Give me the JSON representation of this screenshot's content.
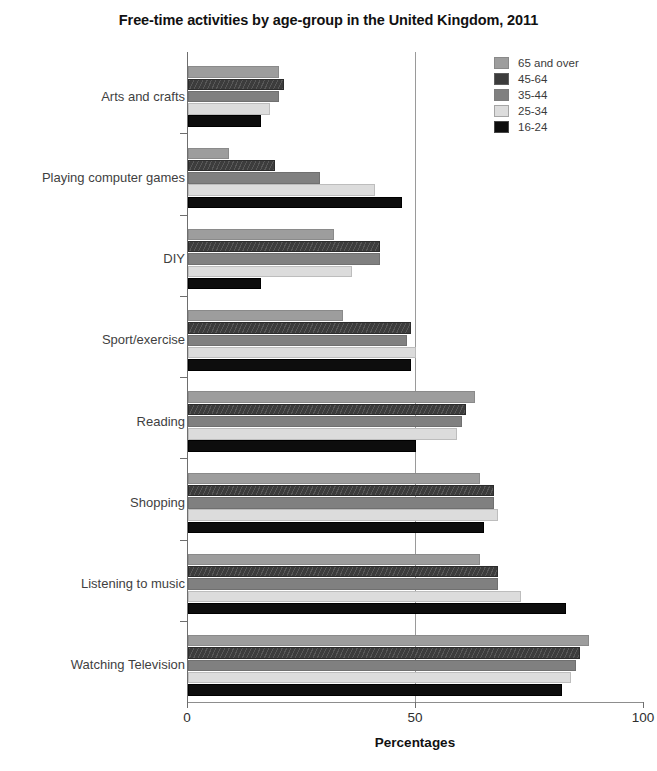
{
  "chart_data": {
    "type": "bar",
    "orientation": "horizontal",
    "title": "Free-time activities by age-group in the United Kingdom, 2011",
    "xlabel": "Percentages",
    "ylabel": "",
    "xlim": [
      0,
      100
    ],
    "xticks": [
      0,
      50,
      100
    ],
    "xtick_labels": [
      "0",
      "50",
      "100"
    ],
    "grid": "vertical gridline at 50",
    "legend_position": "top-right",
    "categories": [
      "Arts and crafts",
      "Playing computer games",
      "DIY",
      "Sport/exercise",
      "Reading",
      "Shopping",
      "Listening to music",
      "Watching Television"
    ],
    "series": [
      {
        "name": "65 and over",
        "color": "#9d9d9d",
        "values": [
          20,
          9,
          32,
          34,
          63,
          64,
          64,
          88
        ]
      },
      {
        "name": "45-64",
        "color": "#3c3c3c",
        "values": [
          21,
          19,
          42,
          49,
          61,
          67,
          68,
          86
        ]
      },
      {
        "name": "35-44",
        "color": "#808080",
        "values": [
          20,
          29,
          42,
          48,
          60,
          67,
          68,
          85
        ]
      },
      {
        "name": "25-34",
        "color": "#dcdcdc",
        "values": [
          18,
          41,
          36,
          50,
          59,
          68,
          73,
          84
        ]
      },
      {
        "name": "16-24",
        "color": "#0d0d0d",
        "values": [
          16,
          47,
          16,
          49,
          50,
          65,
          83,
          82
        ]
      }
    ]
  },
  "legend": {
    "items": [
      {
        "label": "65 and over",
        "swatch": "#9d9d9d"
      },
      {
        "label": "45-64",
        "swatch": "#3c3c3c"
      },
      {
        "label": "35-44",
        "swatch": "#808080"
      },
      {
        "label": "25-34",
        "swatch": "#dcdcdc"
      },
      {
        "label": "16-24",
        "swatch": "#0d0d0d"
      }
    ]
  }
}
